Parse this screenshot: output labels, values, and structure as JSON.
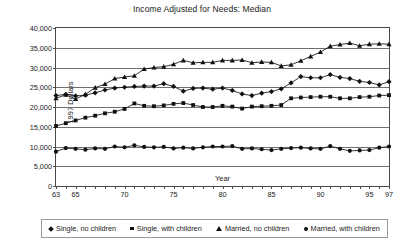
{
  "chart_data": {
    "type": "line",
    "title": "Income Adjusted for Needs: Median",
    "xlabel": "Year",
    "ylabel": "1997 Dollars",
    "ylim": [
      0,
      40000
    ],
    "yticks": [
      "0",
      "5,000",
      "10,000",
      "15,000",
      "20,000",
      "25,000",
      "30,000",
      "35,000",
      "40,000"
    ],
    "ytick_values": [
      0,
      5000,
      10000,
      15000,
      20000,
      25000,
      30000,
      35000,
      40000
    ],
    "xlim": [
      63,
      97
    ],
    "xticks": [
      "63",
      "65",
      "70",
      "75",
      "80",
      "85",
      "90",
      "95",
      "97"
    ],
    "xtick_values": [
      63,
      65,
      70,
      75,
      80,
      85,
      90,
      95,
      97
    ],
    "grid": true,
    "legend_position": "bottom",
    "x": [
      63,
      64,
      65,
      66,
      67,
      68,
      69,
      70,
      71,
      72,
      73,
      74,
      75,
      76,
      77,
      78,
      79,
      80,
      81,
      82,
      83,
      84,
      85,
      86,
      87,
      88,
      89,
      90,
      91,
      92,
      93,
      94,
      95,
      96,
      97
    ],
    "series": [
      {
        "name": "Single, no children",
        "marker": "diamond",
        "values": [
          22900,
          23200,
          22800,
          23000,
          23600,
          24300,
          24800,
          25000,
          25200,
          25300,
          25300,
          25900,
          25200,
          24000,
          24700,
          24800,
          24500,
          24800,
          24200,
          23300,
          22900,
          23500,
          23900,
          24600,
          26100,
          27700,
          27400,
          27400,
          28200,
          27500,
          27200,
          26500,
          26200,
          25600,
          26400
        ]
      },
      {
        "name": "Single, with children",
        "marker": "square",
        "values": [
          15200,
          15900,
          16600,
          17300,
          17800,
          18400,
          18800,
          19500,
          20900,
          20300,
          20200,
          20400,
          20800,
          21000,
          20500,
          20000,
          20000,
          20300,
          20100,
          19600,
          20100,
          20200,
          20300,
          20500,
          22200,
          22400,
          22500,
          22600,
          22600,
          22200,
          22200,
          22500,
          22600,
          22900,
          23000
        ]
      },
      {
        "name": "Married, no children",
        "marker": "triangle",
        "values": [
          22200,
          23100,
          22000,
          23200,
          24900,
          25800,
          27200,
          27600,
          27900,
          29600,
          30000,
          30200,
          30800,
          31800,
          31200,
          31300,
          31300,
          31800,
          31800,
          31900,
          31200,
          31400,
          31300,
          30400,
          30700,
          31700,
          32800,
          33900,
          35400,
          35800,
          36200,
          35500,
          35900,
          36000,
          35900
        ]
      },
      {
        "name": "Married, with children",
        "marker": "circle",
        "values": [
          8700,
          9600,
          9400,
          9200,
          9500,
          9400,
          10000,
          9800,
          10300,
          9900,
          9800,
          9900,
          9500,
          9700,
          9500,
          9800,
          10000,
          10000,
          10100,
          9400,
          9500,
          9300,
          9100,
          9400,
          9600,
          9700,
          9500,
          9400,
          10100,
          9400,
          8900,
          9000,
          9100,
          9700,
          10000
        ]
      }
    ]
  },
  "legend": {
    "items": [
      {
        "label": "Single, no children",
        "marker": "diamond"
      },
      {
        "label": "Single, with children",
        "marker": "square"
      },
      {
        "label": "Married, no children",
        "marker": "triangle"
      },
      {
        "label": "Married, with children",
        "marker": "circle"
      }
    ]
  },
  "colors": {
    "ink": "#111111",
    "grid": "#6f6f6f",
    "frame": "#4a4a4a",
    "background": "#ffffff"
  }
}
